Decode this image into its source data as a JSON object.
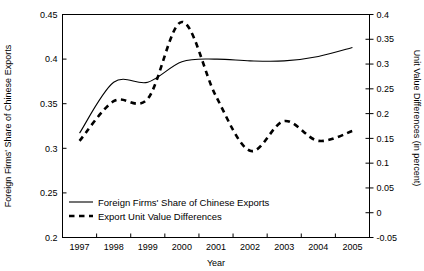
{
  "chart_data": {
    "type": "line",
    "title": "",
    "xlabel": "Year",
    "categories": [
      "1997",
      "1998",
      "1999",
      "2000",
      "2001",
      "2002",
      "2003",
      "2004",
      "2005"
    ],
    "x": [
      1997,
      1998,
      1999,
      2000,
      2001,
      2002,
      2003,
      2004,
      2005
    ],
    "grid": false,
    "legend_position": "bottom-left",
    "axes": {
      "left": {
        "label": "Foreign Firms' Share of Chinese Exports",
        "ylim": [
          0.2,
          0.45
        ],
        "ticks": [
          0.2,
          0.25,
          0.3,
          0.35,
          0.4,
          0.45
        ],
        "tick_labels": [
          "0.2",
          "0.25",
          "0.3",
          "0.35",
          "0.4",
          "0.45"
        ]
      },
      "right": {
        "label": "Unit Value Differences (in percent)",
        "ylim": [
          -0.05,
          0.4
        ],
        "ticks": [
          -0.05,
          0,
          0.05,
          0.1,
          0.15,
          0.2,
          0.25,
          0.3,
          0.35,
          0.4
        ],
        "tick_labels": [
          "-0.05",
          "0",
          "0.05",
          "0.1",
          "0.15",
          "0.2",
          "0.25",
          "0.3",
          "0.35",
          "0.4"
        ]
      },
      "x": {
        "label": "Year",
        "ticks": [
          1997,
          1998,
          1999,
          2000,
          2001,
          2002,
          2003,
          2004,
          2005
        ],
        "tick_labels": [
          "1997",
          "1998",
          "1999",
          "2000",
          "2001",
          "2002",
          "2003",
          "2004",
          "2005"
        ]
      }
    },
    "series": [
      {
        "name": "Foreign Firms' Share of Chinese Exports",
        "axis": "left",
        "style": "solid",
        "values": [
          0.317,
          0.374,
          0.374,
          0.397,
          0.4,
          0.398,
          0.398,
          0.403,
          0.413
        ]
      },
      {
        "name": "Export Unit Value Differences",
        "axis": "right",
        "style": "dashed",
        "values": [
          0.145,
          0.225,
          0.23,
          0.385,
          0.235,
          0.125,
          0.185,
          0.145,
          0.165
        ]
      }
    ],
    "legend": [
      {
        "label": "Foreign Firms' Share of Chinese Exports",
        "style": "solid"
      },
      {
        "label": "Export Unit Value Differences",
        "style": "dashed"
      }
    ]
  }
}
